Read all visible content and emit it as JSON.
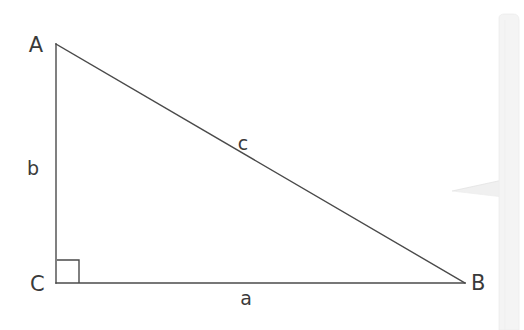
{
  "canvas": {
    "width": 524,
    "height": 330,
    "background_color": "#ffffff"
  },
  "figure": {
    "type": "right-triangle",
    "stroke_color": "#4a4a4a",
    "stroke_width": 1.4,
    "label_color": "#3a3a3a",
    "vertices": [
      {
        "key": "A",
        "label": "A",
        "x": 56,
        "y": 44,
        "label_x": 36,
        "label_y": 52
      },
      {
        "key": "B",
        "label": "B",
        "x": 465,
        "y": 283,
        "label_x": 471,
        "label_y": 290
      },
      {
        "key": "C",
        "label": "C",
        "x": 56,
        "y": 283,
        "label_x": 30,
        "label_y": 291
      }
    ],
    "sides": [
      {
        "key": "a",
        "label": "a",
        "from": "C",
        "to": "B",
        "label_x": 246,
        "label_y": 305
      },
      {
        "key": "b",
        "label": "b",
        "from": "A",
        "to": "C",
        "label_x": 33,
        "label_y": 175
      },
      {
        "key": "c",
        "label": "c",
        "from": "A",
        "to": "B",
        "label_x": 243,
        "label_y": 150
      }
    ],
    "right_angle_marker": {
      "at_vertex": "C",
      "size": 23,
      "x": 56,
      "y": 283
    }
  },
  "watermark": {
    "description": "faint light-gray pointer and vertical bar artifact at right edge",
    "color": "#ececec",
    "bar_x": 497,
    "bar_top": 18,
    "bar_width": 20,
    "pointer_tip_x": 452,
    "pointer_y": 190
  }
}
